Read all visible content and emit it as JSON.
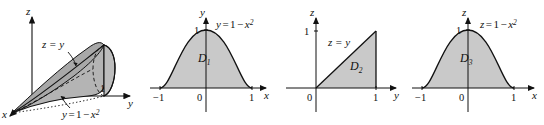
{
  "figure": {
    "background_color": "#ffffff",
    "ink_color": "#111111",
    "region_fill_color": "#c9c9c9",
    "solid_fill_color": "#b8b8b8",
    "solid_fill_color_dark": "#a5a5a5",
    "panel_count": 4
  },
  "panels": [
    {
      "id": "solid",
      "type": "3d-solid",
      "axes": [
        {
          "name": "z",
          "label": "z",
          "direction": "up"
        },
        {
          "name": "y",
          "label": "y",
          "direction": "right"
        },
        {
          "name": "x",
          "label": "x",
          "direction": "down-left"
        }
      ],
      "tick_labels": [
        {
          "axis": "y",
          "value": "1"
        }
      ],
      "surface_labels": [
        {
          "base": "z",
          "relation": "=",
          "expr": "y",
          "full": "z = y"
        },
        {
          "base": "y",
          "relation": "=",
          "expr": "1 − x²",
          "full": "y = 1 − x²"
        }
      ],
      "description": "Solid bounded above by the plane z = y and laterally by the parabolic cylinder y = 1 − x²"
    },
    {
      "id": "d1",
      "type": "2d-region",
      "axes": [
        {
          "name": "x",
          "label": "x",
          "direction": "right"
        },
        {
          "name": "y",
          "label": "y",
          "direction": "up"
        }
      ],
      "tick_labels": [
        {
          "axis": "x",
          "value": "-1",
          "display": "−1"
        },
        {
          "axis": "origin",
          "value": "0",
          "display": "0"
        },
        {
          "axis": "x",
          "value": "1",
          "display": "1"
        },
        {
          "axis": "y",
          "value": "1",
          "display": "1"
        }
      ],
      "region_label": "D",
      "region_subscript": "1",
      "curve_label": {
        "lhs": "y",
        "relation": "=",
        "rhs_pre": "1 − x",
        "rhs_exp": "2",
        "full": "y = 1 − x²"
      },
      "description": "Region under the parabola y = 1 − x² above the x-axis from x = −1 to x = 1"
    },
    {
      "id": "d2",
      "type": "2d-region",
      "axes": [
        {
          "name": "y",
          "label": "y",
          "direction": "right"
        },
        {
          "name": "z",
          "label": "z",
          "direction": "up"
        }
      ],
      "tick_labels": [
        {
          "axis": "origin",
          "value": "0",
          "display": "0"
        },
        {
          "axis": "y",
          "value": "1",
          "display": "1"
        },
        {
          "axis": "z",
          "value": "1",
          "display": "1"
        }
      ],
      "region_label": "D",
      "region_subscript": "2",
      "curve_label": {
        "lhs": "z",
        "relation": "=",
        "rhs_pre": "y",
        "rhs_exp": "",
        "full": "z = y"
      },
      "description": "Triangular region with vertices (0,0), (1,0), (1,1) bounded above by z = y"
    },
    {
      "id": "d3",
      "type": "2d-region",
      "axes": [
        {
          "name": "x",
          "label": "x",
          "direction": "right"
        },
        {
          "name": "z",
          "label": "z",
          "direction": "up"
        }
      ],
      "tick_labels": [
        {
          "axis": "x",
          "value": "-1",
          "display": "−1"
        },
        {
          "axis": "origin",
          "value": "0",
          "display": "0"
        },
        {
          "axis": "x",
          "value": "1",
          "display": "1"
        },
        {
          "axis": "z",
          "value": "1",
          "display": "1"
        }
      ],
      "region_label": "D",
      "region_subscript": "3",
      "curve_label": {
        "lhs": "z",
        "relation": "=",
        "rhs_pre": "1 − x",
        "rhs_exp": "2",
        "full": "z = 1 − x²"
      },
      "description": "Region under the parabola z = 1 − x² above the x-axis from x = −1 to x = 1"
    }
  ]
}
